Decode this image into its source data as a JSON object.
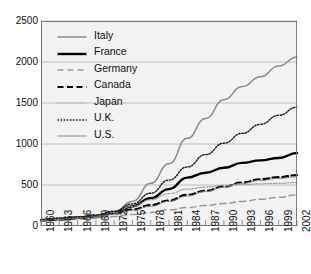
{
  "chart_data": {
    "type": "line",
    "title": "",
    "xlabel": "",
    "ylabel": "",
    "xlim": [
      1960,
      2002
    ],
    "ylim": [
      0,
      2500
    ],
    "grid": true,
    "legend_position": "upper-left-inside",
    "yticks": [
      0,
      500,
      1000,
      1500,
      2000,
      2500
    ],
    "xticks": [
      1960,
      1963,
      1966,
      1969,
      1972,
      1975,
      1978,
      1981,
      1984,
      1987,
      1990,
      1993,
      1996,
      1999,
      2002
    ],
    "x": [
      1960,
      1963,
      1966,
      1969,
      1972,
      1975,
      1978,
      1981,
      1984,
      1987,
      1990,
      1993,
      1996,
      1999,
      2002
    ],
    "series": [
      {
        "name": "Italy",
        "style": "solid-thin-gray",
        "color": "#8c8c8c",
        "values": [
          80,
          95,
          110,
          130,
          175,
          300,
          520,
          760,
          1070,
          1310,
          1540,
          1700,
          1820,
          1950,
          2060
        ]
      },
      {
        "name": "France",
        "style": "solid-thick-black",
        "color": "#000000",
        "values": [
          70,
          85,
          100,
          120,
          160,
          240,
          340,
          450,
          590,
          650,
          710,
          770,
          800,
          830,
          890
        ]
      },
      {
        "name": "Germany",
        "style": "dashed-gray",
        "color": "#9a9a9a",
        "values": [
          65,
          75,
          85,
          95,
          115,
          140,
          165,
          195,
          225,
          250,
          275,
          300,
          325,
          350,
          380
        ]
      },
      {
        "name": "Canada",
        "style": "dashed-thick-black",
        "color": "#000000",
        "values": [
          70,
          80,
          95,
          115,
          150,
          200,
          255,
          310,
          380,
          430,
          480,
          530,
          570,
          595,
          620
        ]
      },
      {
        "name": "Japan",
        "style": "dotted-fine-gray",
        "color": "#999999",
        "values": [
          75,
          90,
          105,
          125,
          165,
          240,
          320,
          395,
          450,
          475,
          495,
          505,
          515,
          520,
          530
        ]
      },
      {
        "name": "U.K.",
        "style": "dotted-black",
        "color": "#1a1a1a",
        "values": [
          80,
          95,
          110,
          135,
          180,
          270,
          400,
          560,
          720,
          870,
          1010,
          1130,
          1240,
          1350,
          1450
        ]
      },
      {
        "name": "U.S.",
        "style": "solid-thin-gray2",
        "color": "#8a8a8a",
        "values": [
          70,
          80,
          95,
          110,
          145,
          190,
          240,
          300,
          365,
          420,
          470,
          520,
          555,
          580,
          600
        ]
      }
    ]
  },
  "legend": {
    "items": [
      {
        "label": "Italy"
      },
      {
        "label": "France"
      },
      {
        "label": "Germany"
      },
      {
        "label": "Canada"
      },
      {
        "label": "Japan"
      },
      {
        "label": "U.K."
      },
      {
        "label": "U.S."
      }
    ]
  },
  "axes": {
    "y_labels": [
      "2500",
      "2000",
      "1500",
      "1000",
      "500",
      "0"
    ],
    "x_labels": [
      "1960",
      "1963",
      "1966",
      "1969",
      "1972",
      "1975",
      "1978",
      "1981",
      "1984",
      "1987",
      "1990",
      "1993",
      "1996",
      "1999",
      "2002"
    ]
  },
  "colors": {
    "plot_background": "#f2f2f2",
    "page_background": "#ffffff",
    "axis": "#7a7a7a",
    "gridline": "#b3b3b3",
    "text": "#111111"
  }
}
